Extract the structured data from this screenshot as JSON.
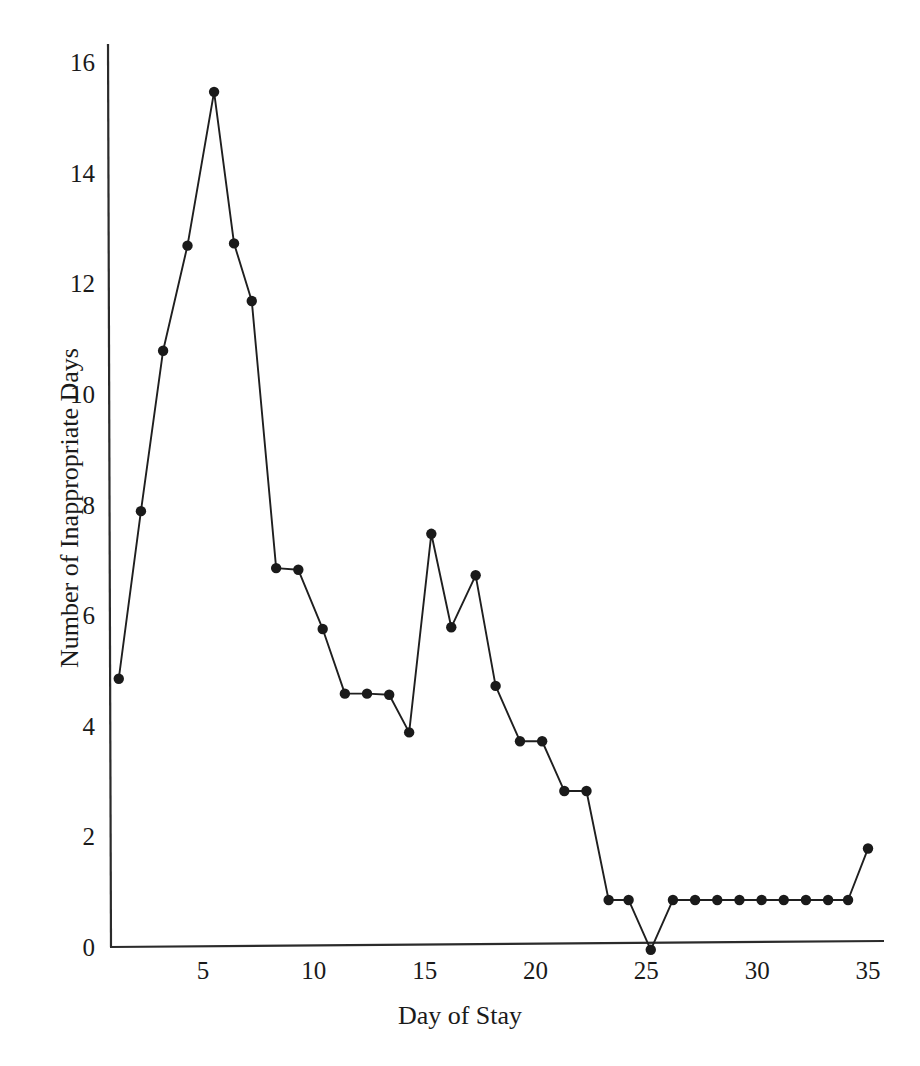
{
  "chart_data": {
    "type": "line",
    "title": "",
    "subtitle": "",
    "xlabel": "Day of Stay",
    "ylabel": "Number of Inappropriate Days",
    "xlim": [
      0.5,
      35.8
    ],
    "ylim": [
      0,
      16.7
    ],
    "grid": false,
    "legend": null,
    "marker": "filled-circle",
    "line_color": "#1a1a1a",
    "marker_color": "#1a1a1a",
    "background_color": "#ffffff",
    "xticks": [
      5,
      10,
      15,
      20,
      25,
      30,
      35
    ],
    "xtick_labels": [
      "5",
      "10",
      "15",
      "20",
      "25",
      "30",
      "35"
    ],
    "yticks": [
      0,
      2,
      4,
      6,
      8,
      10,
      12,
      14,
      16
    ],
    "ytick_labels": [
      "0",
      "2",
      "4",
      "6",
      "8",
      "10",
      "12",
      "14",
      "16"
    ],
    "x": [
      1.2,
      2.2,
      3.2,
      4.3,
      5.5,
      6.4,
      7.2,
      8.3,
      9.3,
      10.4,
      11.4,
      12.4,
      13.4,
      14.3,
      15.3,
      16.2,
      17.3,
      18.2,
      19.3,
      20.3,
      21.3,
      22.3,
      23.3,
      24.2,
      25.2,
      26.2,
      27.2,
      28.2,
      29.2,
      30.2,
      31.2,
      32.2,
      33.2,
      34.1,
      35.0
    ],
    "y": [
      4.85,
      7.88,
      10.78,
      12.68,
      15.46,
      12.72,
      11.68,
      6.85,
      6.82,
      5.75,
      4.58,
      4.58,
      4.56,
      3.88,
      7.47,
      5.78,
      6.72,
      4.72,
      3.72,
      3.72,
      2.82,
      2.82,
      0.85,
      0.85,
      -0.05,
      0.85,
      0.85,
      0.85,
      0.85,
      0.85,
      0.85,
      0.85,
      0.85,
      0.85,
      1.78
    ],
    "series": [
      {
        "name": "Inappropriate days by day of stay",
        "values": [
          4.85,
          7.88,
          10.78,
          12.68,
          15.46,
          12.72,
          11.68,
          6.85,
          6.82,
          5.75,
          4.58,
          4.58,
          4.56,
          3.88,
          7.47,
          5.78,
          6.72,
          4.72,
          3.72,
          3.72,
          2.82,
          2.82,
          0.85,
          0.85,
          -0.05,
          0.85,
          0.85,
          0.85,
          0.85,
          0.85,
          0.85,
          0.85,
          0.85,
          0.85,
          1.78
        ]
      }
    ]
  },
  "axes": {
    "x_title": "Day of Stay",
    "y_title": "Number of Inappropriate Days"
  }
}
